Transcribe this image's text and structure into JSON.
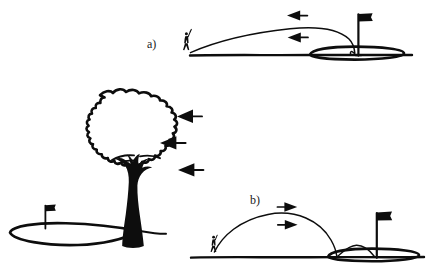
{
  "figure": {
    "background_color": "#ffffff",
    "ink_color": "#0d0d0d",
    "style": "hand-drawn pen sketch"
  },
  "panels": [
    {
      "id": "a",
      "label": "a)",
      "description": "Low flat trajectory played into a headwind, ball checks up by the hole",
      "wind_direction": "left",
      "wind_arrow_count": 2,
      "trajectory_shape": "low flat boring flight",
      "landing": "short hop then stops at the pin",
      "golfer": "golfer-silhouette",
      "flag": "flag-on-green"
    },
    {
      "id": "b",
      "label": "b)",
      "description": "High arcing trajectory played downwind, ball lands and bounces on toward the pin",
      "wind_direction": "right",
      "wind_arrow_count": 2,
      "trajectory_shape": "high symmetric arc",
      "landing": "lands short of green and takes a long bounce",
      "golfer": "golfer-silhouette",
      "flag": "flag-on-green"
    }
  ],
  "tree_scene": {
    "description": "Large leafy tree bending in the wind beside a putting green",
    "wind_direction": "left",
    "wind_arrow_count": 3,
    "elements": [
      "tree-crown",
      "tree-trunk",
      "green-outline",
      "flag"
    ]
  },
  "icons": {
    "wind_arrow_left": "arrow-left-icon",
    "wind_arrow_right": "arrow-right-icon",
    "golfer": "golfer-icon",
    "flag": "flag-icon",
    "tree": "tree-icon"
  }
}
